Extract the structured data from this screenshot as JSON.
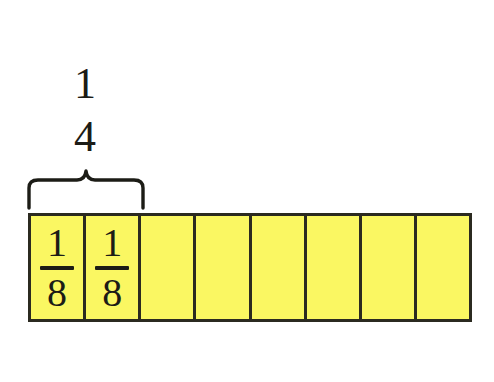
{
  "canvas": {
    "width": 494,
    "height": 382,
    "background": "#ffffff"
  },
  "colors": {
    "cell_fill": "#faf762",
    "border": "#2b2a20",
    "text": "#1c1c16",
    "brace": "#1c1c16"
  },
  "label": {
    "name": "one-fourth",
    "numerator": "1",
    "denominator": "4"
  },
  "brace": {
    "name": "brace",
    "spans_cells": 2,
    "orientation": "top"
  },
  "bar": {
    "name": "fraction-bar",
    "total_cells": 8,
    "cells": [
      {
        "numerator": "1",
        "denominator": "8",
        "labeled": true
      },
      {
        "numerator": "1",
        "denominator": "8",
        "labeled": true
      },
      {
        "numerator": "",
        "denominator": "",
        "labeled": false
      },
      {
        "numerator": "",
        "denominator": "",
        "labeled": false
      },
      {
        "numerator": "",
        "denominator": "",
        "labeled": false
      },
      {
        "numerator": "",
        "denominator": "",
        "labeled": false
      },
      {
        "numerator": "",
        "denominator": "",
        "labeled": false
      },
      {
        "numerator": "",
        "denominator": "",
        "labeled": false
      }
    ]
  }
}
